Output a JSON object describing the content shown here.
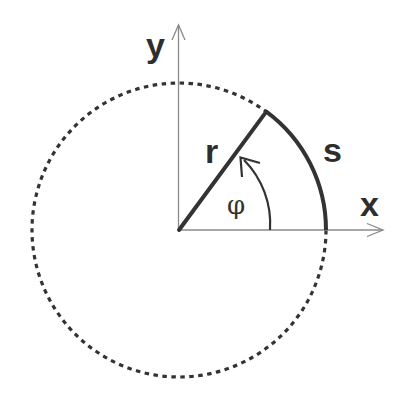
{
  "diagram": {
    "type": "polar-arc-geometry",
    "labels": {
      "x_axis": "x",
      "y_axis": "y",
      "radius": "r",
      "arc_length": "s",
      "angle": "φ"
    },
    "colors": {
      "stroke": "#333333",
      "axis": "#8a8a8a",
      "background": "#ffffff"
    },
    "elements": [
      {
        "name": "circle",
        "style": "dotted",
        "center": [
          179,
          230
        ],
        "radius": 147
      },
      {
        "name": "x-axis",
        "style": "thin-arrow"
      },
      {
        "name": "y-axis",
        "style": "thin-arrow"
      },
      {
        "name": "radius-line",
        "style": "thick",
        "label": "r"
      },
      {
        "name": "arc-s",
        "style": "thick",
        "label": "s",
        "angle_deg": 53.6
      },
      {
        "name": "angle-arrow",
        "style": "arrow-arc",
        "label": "φ"
      }
    ]
  }
}
